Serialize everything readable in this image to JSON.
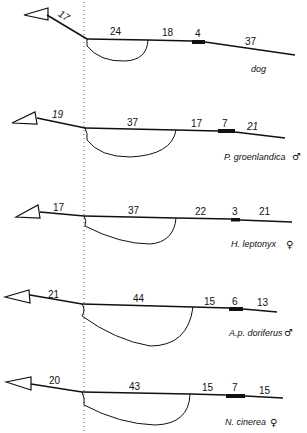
{
  "figure": {
    "reference_line": "dotted vertical",
    "diagrams": [
      {
        "species": "dog",
        "sex_symbol": "",
        "segments": {
          "arrow_segment": "17",
          "loop_segment": "24",
          "middle_segment": "18",
          "bar_segment": "4",
          "tail_segment": "37"
        }
      },
      {
        "species": "P. groenlandica",
        "sex_symbol": "♂",
        "segments": {
          "arrow_segment": "19",
          "loop_segment": "37",
          "middle_segment": "17",
          "bar_segment": "7",
          "tail_segment": "21"
        }
      },
      {
        "species": "H. leptonyx",
        "sex_symbol": "♀",
        "segments": {
          "arrow_segment": "17",
          "loop_segment": "37",
          "middle_segment": "22",
          "bar_segment": "3",
          "tail_segment": "21"
        }
      },
      {
        "species": "A.p. doriferus",
        "sex_symbol": "♂",
        "segments": {
          "arrow_segment": "21",
          "loop_segment": "44",
          "middle_segment": "15",
          "bar_segment": "6",
          "tail_segment": "13"
        }
      },
      {
        "species": "N. cinerea",
        "sex_symbol": "♀",
        "segments": {
          "arrow_segment": "20",
          "loop_segment": "43",
          "middle_segment": "15",
          "bar_segment": "7",
          "tail_segment": "15"
        }
      }
    ]
  }
}
